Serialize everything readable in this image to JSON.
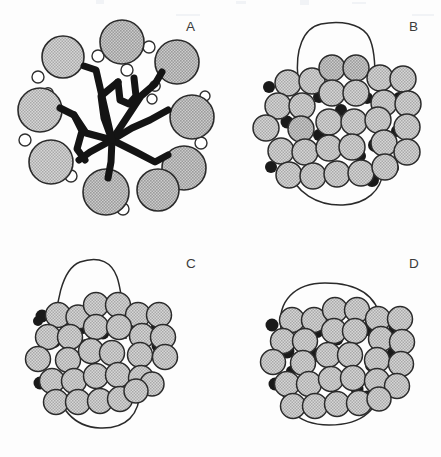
{
  "figure": {
    "background_color": "#fdfdfd",
    "width": 441,
    "height": 457,
    "panel_count": 4
  },
  "palette": {
    "large_circle_fill": "#c8c8c8",
    "large_circle_stroke": "#2b2b2b",
    "small_circle_fill": "#ffffff",
    "small_circle_stroke": "#2f2f2f",
    "black_dot_fill": "#1a1a1a",
    "network_color": "#141414",
    "membrane_outline": "#2a2a2a",
    "label_color": "#3b3b3b"
  },
  "panels": [
    {
      "id": "A",
      "label": "A",
      "description": "Ring of large stippled circles surrounding a thick black branching network, with small open circles interspersed",
      "large_circles": [
        {
          "cx": 63,
          "cy": 57,
          "r": 21
        },
        {
          "cx": 122,
          "cy": 42,
          "r": 22
        },
        {
          "cx": 177,
          "cy": 62,
          "r": 22
        },
        {
          "cx": 40,
          "cy": 110,
          "r": 22
        },
        {
          "cx": 191,
          "cy": 117,
          "r": 22
        },
        {
          "cx": 51,
          "cy": 162,
          "r": 22
        },
        {
          "cx": 183,
          "cy": 168,
          "r": 22
        },
        {
          "cx": 106,
          "cy": 191,
          "r": 23
        },
        {
          "cx": 158,
          "cy": 190,
          "r": 21
        },
        {
          "cx": 77,
          "cy": 196,
          "r": 0
        }
      ],
      "small_circles": [
        {
          "cx": 149,
          "cy": 47,
          "r": 6
        },
        {
          "cx": 98,
          "cy": 56,
          "r": 6
        },
        {
          "cx": 127,
          "cy": 70,
          "r": 6
        },
        {
          "cx": 38,
          "cy": 77,
          "r": 6
        },
        {
          "cx": 155,
          "cy": 86,
          "r": 5
        },
        {
          "cx": 48,
          "cy": 93,
          "r": 5
        },
        {
          "cx": 152,
          "cy": 98,
          "r": 5
        },
        {
          "cx": 25,
          "cy": 140,
          "r": 6
        },
        {
          "cx": 200,
          "cy": 143,
          "r": 6
        },
        {
          "cx": 71,
          "cy": 176,
          "r": 6
        },
        {
          "cx": 168,
          "cy": 171,
          "r": 5
        },
        {
          "cx": 123,
          "cy": 209,
          "r": 6
        },
        {
          "cx": 88,
          "cy": 175,
          "r": 5
        },
        {
          "cx": 205,
          "cy": 95,
          "r": 5
        }
      ],
      "network_branches": 9,
      "network_stroke_width": 7
    },
    {
      "id": "B",
      "label": "B",
      "description": "Densely packed cluster of large stippled circles with interstitial black dots and a thin closed membrane outline looping above and below",
      "cluster_rows": 5,
      "large_circle_count": 29,
      "black_dot_count": 15,
      "membrane_shape": "tall rounded loop above cluster, sweeping arc below"
    },
    {
      "id": "C",
      "label": "C",
      "description": "Packed cluster with a tall narrow dome-shaped membrane outline rising above and a rounded arc below",
      "cluster_rows": 5,
      "large_circle_count": 29,
      "black_dot_count": 16,
      "membrane_shape": "tall narrow dome above cluster, broad arc below"
    },
    {
      "id": "D",
      "label": "D",
      "description": "Packed cluster with a wide flattened membrane outline wrapping around the cluster top and bottom",
      "cluster_rows": 5,
      "large_circle_count": 30,
      "black_dot_count": 15,
      "membrane_shape": "wide flat loop encircling cluster"
    }
  ]
}
